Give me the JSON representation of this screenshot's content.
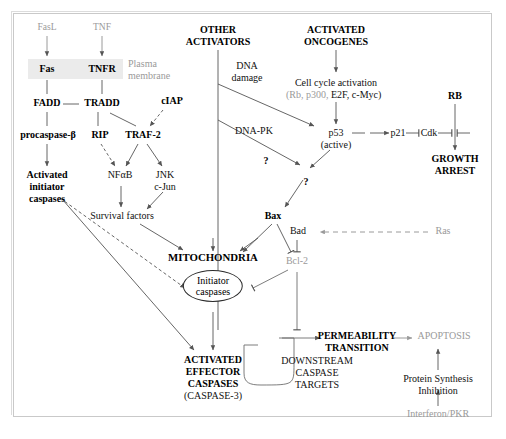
{
  "diagram": {
    "frame_color": "#c9c9c9",
    "membrane_color": "#ebebeb",
    "gray_text_color": "#9a9a9a",
    "line_color": "#555555"
  },
  "nodes": {
    "fasl": "FasL",
    "tnf": "TNF",
    "fas": "Fas",
    "tnfr": "TNFR",
    "plasma_membrane_l1": "Plasma",
    "plasma_membrane_l2": "membrane",
    "fadd": "FADD",
    "tradd": "TRADD",
    "ciap": "cIAP",
    "procaspase": "procaspase-β",
    "rip": "RIP",
    "traf2": "TRAF-2",
    "nfab": "NFαB",
    "jnk": "JNK",
    "cjun": "c-Jun",
    "activated_initiator_l1": "Activated",
    "activated_initiator_l2": "initiator",
    "activated_initiator_l3": "caspases",
    "survival_factors": "Survival factors",
    "other_activators_l1": "OTHER",
    "other_activators_l2": "ACTIVATORS",
    "dna_damage_l1": "DNA",
    "dna_damage_l2": "damage",
    "dna_pk": "DNA-PK",
    "question_1": "?",
    "question_2": "?",
    "activated_oncogenes_l1": "ACTIVATED",
    "activated_oncogenes_l2": "ONCOGENES",
    "cell_cycle_activation": "Cell cycle activation",
    "cell_cycle_genes_gray": "(Rb, p300,",
    "cell_cycle_genes_black": "E2F, c-Myc)",
    "p53": "p53",
    "p53_state": "(active)",
    "p21": "p21",
    "cdk": "Cdk",
    "rb": "RB",
    "growth_arrest_l1": "GROWTH",
    "growth_arrest_l2": "ARREST",
    "bax": "Bax",
    "bad": "Bad",
    "ras": "Ras",
    "bcl2": "Bcl-2",
    "mitochondria": "MITOCHONDRIA",
    "initiator_caspases_l1": "Initiator",
    "initiator_caspases_l2": "caspases",
    "activated_effector_l1": "ACTIVATED",
    "activated_effector_l2": "EFFECTOR",
    "activated_effector_l3": "CASPASES",
    "caspase3": "(CASPASE-3)",
    "downstream_l1": "DOWNSTREAM",
    "downstream_l2": "CASPASE",
    "downstream_l3": "TARGETS",
    "permeability_l1": "PERMEABILITY",
    "permeability_l2": "TRANSITION",
    "apoptosis": "APOPTOSIS",
    "protein_synthesis_l1": "Protein Synthesis",
    "protein_synthesis_l2": "Inhibition",
    "interferon_pkr": "Interferon/PKR"
  }
}
